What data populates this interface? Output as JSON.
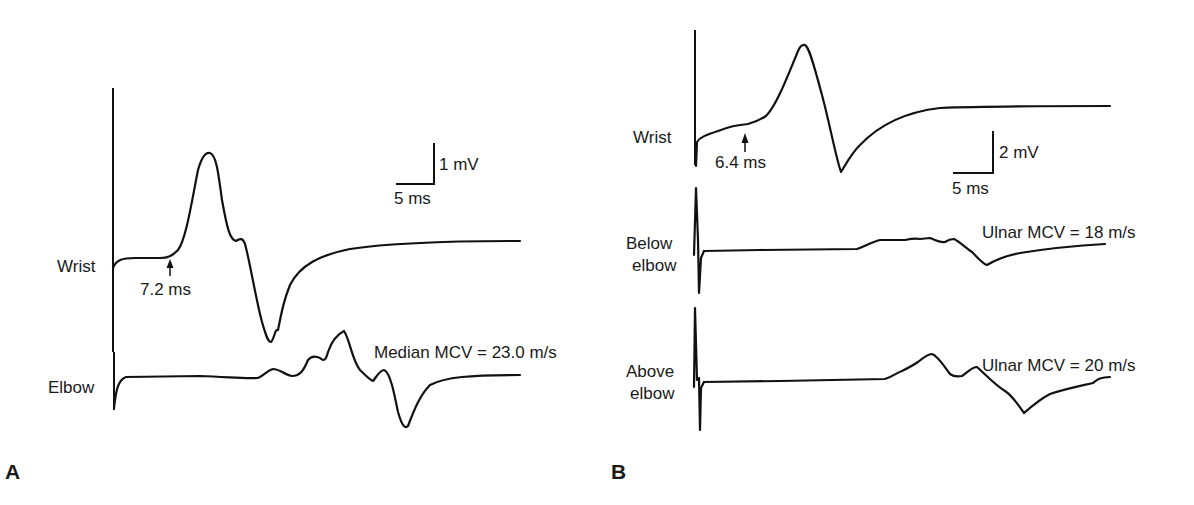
{
  "colors": {
    "trace": "#111111",
    "background": "#ffffff",
    "text": "#1a1a1a"
  },
  "panel_a": {
    "letter": "A",
    "scale_bar": {
      "vertical_label": "1 mV",
      "horizontal_label": "5 ms"
    },
    "traces": [
      {
        "label": "Wrist",
        "onset_annotation": "7.2 ms",
        "path": "M113,268 C116,260 122,258 135,258 L160,258 C168,258 172,256 178,250 C186,240 192,200 198,170 C202,156 206,152 210,153 C216,155 218,170 222,200 C227,228 230,240 236,241 C240,238 243,238 245,244 C250,262 256,300 262,322 C266,336 268,342 271,342 C274,340 275,328 278,330 C282,310 284,300 290,285 C300,265 320,255 350,249 C390,243 440,241 520,241"
      },
      {
        "label": "Elbow",
        "annotation": "Median MCV = 23.0 m/s",
        "path": "M114,408 C116,390 118,380 126,377 L200,376 C230,377 245,379 258,378 C265,375 268,370 273,369 C280,369 285,375 292,376 C300,376 304,370 308,360 C312,355 316,356 320,358 C324,362 326,360 328,352 C332,340 338,334 344,331 C350,340 352,360 360,370 C366,376 370,380 373,381 C377,376 380,370 384,370 C390,372 394,392 398,412 C402,426 405,429 408,426 C414,410 420,395 430,385 C445,377 470,375 520,375"
      }
    ]
  },
  "panel_b": {
    "letter": "B",
    "scale_bar": {
      "vertical_label": "2 mV",
      "horizontal_label": "5 ms"
    },
    "traces": [
      {
        "label": "Wrist",
        "onset_annotation": "6.4 ms",
        "axis_path": "M695,30 L695,165",
        "path": "M696,166 L697,142 C700,137 706,135 718,131 C728,127 735,125 748,124 C755,122 760,120 766,116 C776,106 786,80 796,56 C799,48 801,44 805,45 C810,48 815,70 822,95 C830,125 836,158 841,172 C845,166 850,155 860,145 C880,124 905,112 940,108 C990,106 1050,106 1110,106"
      },
      {
        "label_lines": [
          "Below",
          "elbow"
        ],
        "annotation": "Ulnar MCV = 18 m/s",
        "spike_path": "M694,255 L696,188 L698,240 L699,293 L701,258 L704,251",
        "path": "M704,251 L760,250 L857,249 C865,246 872,242 880,240 L905,240 C910,239 915,238 920,239 L930,238 C936,240 940,243 945,242 C948,240 950,239 954,239 C960,242 966,248 972,252 C978,258 983,264 987,265 C995,260 1005,256 1020,253 C1045,249 1070,246 1105,244"
      },
      {
        "label_lines": [
          "Above",
          "elbow"
        ],
        "annotation": "Ulnar MCV = 20 m/s",
        "spike_path": "M694,387 L695,308 L697,380 L699,378 L700,430 L701,388 L704,382",
        "path": "M704,382 L780,381 L885,379 C892,377 896,373 902,371 C908,368 912,366 918,362 C924,357 928,354 932,354 C938,356 944,366 950,374 C954,377 957,377 962,376 C968,372 972,367 977,367 C985,374 995,385 1005,391 C1013,396 1018,405 1024,413 C1032,406 1040,399 1050,394 C1065,389 1080,386 1093,383 C1097,380 1100,377 1110,377"
      }
    ]
  }
}
